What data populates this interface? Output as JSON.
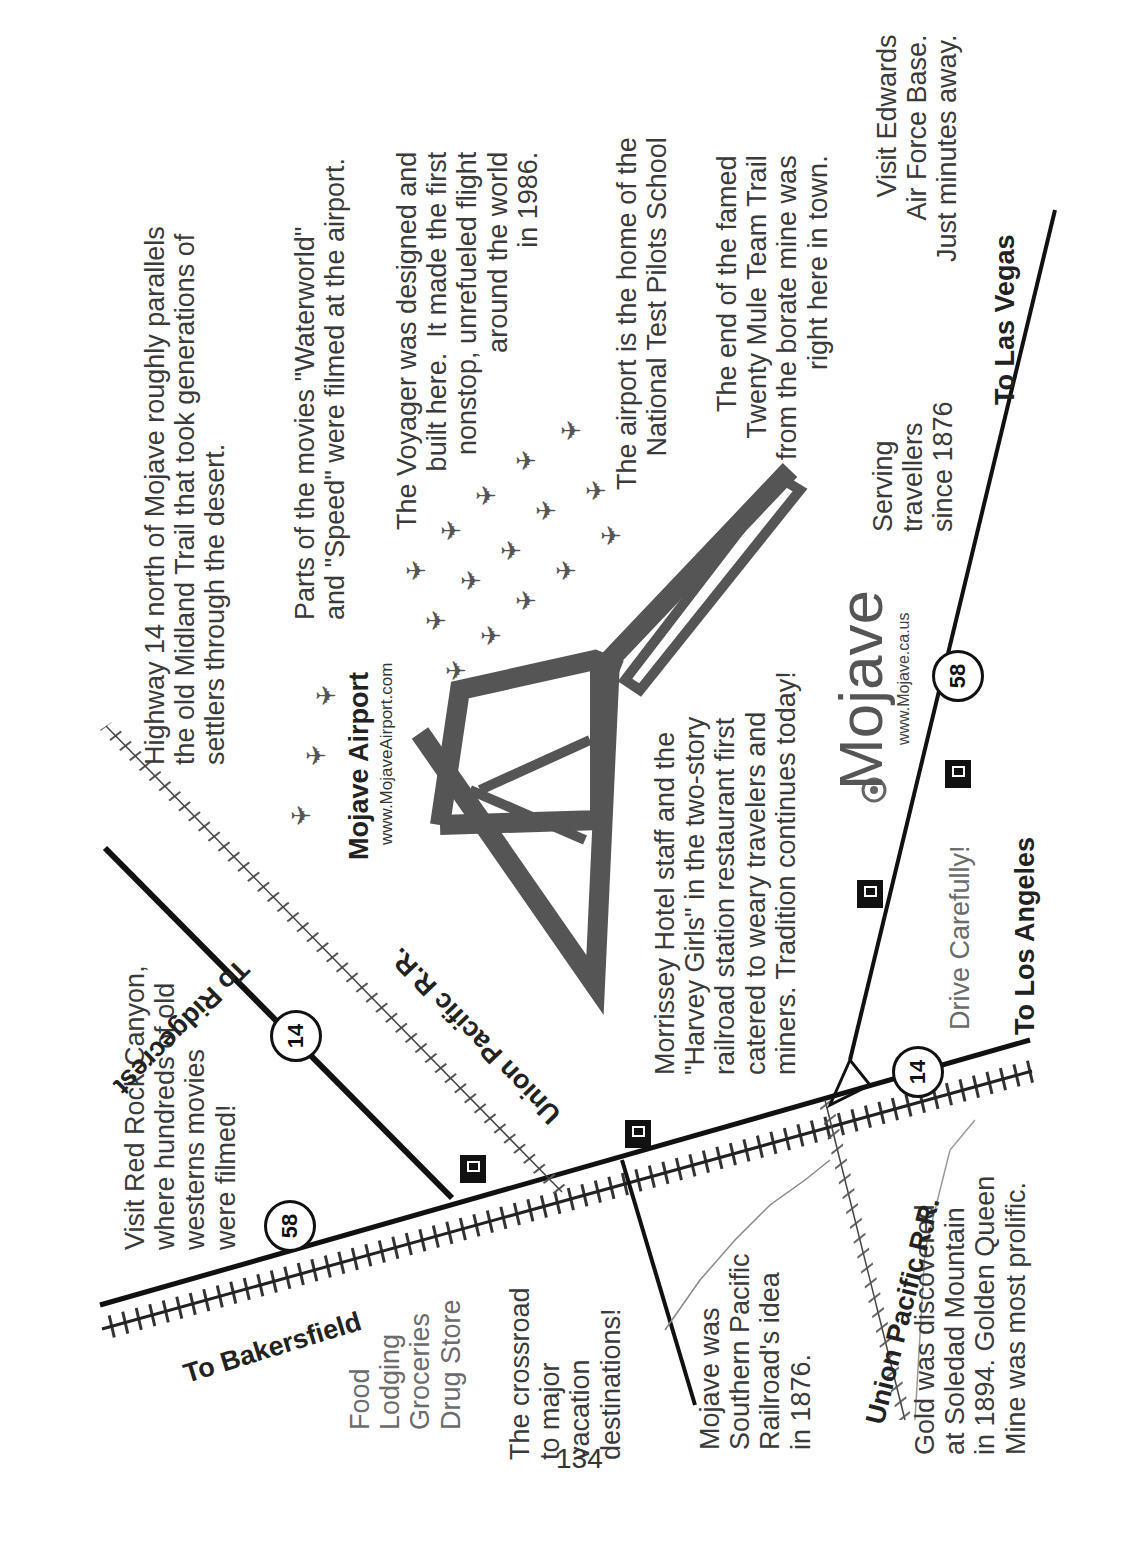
{
  "page_number": "134",
  "map": {
    "roads": {
      "to_bakersfield": "To Bakersfield",
      "to_ridgecrest": "To Ridgecrest",
      "to_los_angeles": "To Los Angeles",
      "to_las_vegas": "To Las Vegas"
    },
    "highway_shields": [
      "58",
      "14",
      "14",
      "58"
    ],
    "railroads": {
      "upper": "Union Pacific R.R.",
      "lower": "Union Pacific R.R."
    },
    "town": {
      "name": "Mojave",
      "url": "www.Mojave.ca.us",
      "tagline": "Serving\ntravellers\nsince 1876",
      "drive_note": "Drive Carefully!"
    },
    "airport": {
      "name": "Mojave Airport",
      "url": "www.MojaveAirport.com"
    },
    "services": "Food\nLodging\nGroceries\nDrug Store",
    "notes": {
      "red_rock": "Visit Red Rock Canyon,\nwhere hundreds of old\nwesterns movies\nwere filmed!",
      "highway14": "Highway 14 north of Mojave roughly parallels\nthe old Midland Trail that took generations of\nsettlers through the desert.",
      "movies": "Parts of the movies \"Waterworld\"\nand \"Speed\" were filmed at the airport.",
      "voyager": "The Voyager was designed and\nbuilt here.  It made the first\nnonstop, unrefueled flight\naround the world\nin 1986.",
      "test_pilots": "The airport is the home of the\nNational Test Pilots School",
      "mule_team": "The end of the famed\nTwenty Mule Team Trail\nfrom the borate mine was\nright here in town.",
      "edwards": "Visit Edwards\nAir Force Base.\nJust minutes away.",
      "morrissey": "Morrissey Hotel staff and the\n\"Harvey Girls\" in the two-story\nrailroad station restaurant first\ncatered to weary travelers and\nminers. Tradition continues today!",
      "crossroad": "The crossroad\nto major\nvacation\ndestinations!",
      "southern_pacific": "Mojave was\nSouthern Pacific\nRailroad's idea\nin 1876.",
      "gold": "Gold was discovered\nat Soledad Mountain\nin 1894. Golden Queen\nMine was most prolific."
    }
  }
}
